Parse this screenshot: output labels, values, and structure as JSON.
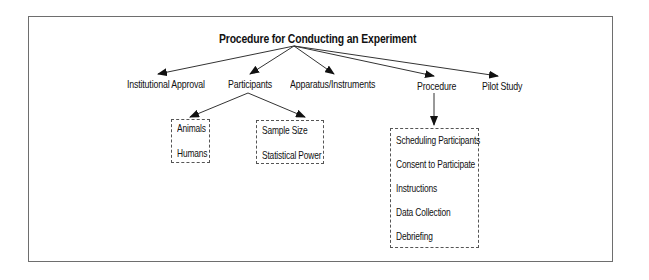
{
  "diagram": {
    "title": "Procedure for Conducting an Experiment",
    "nodes": {
      "institutional": "Institutional Approval",
      "participants": "Participants",
      "apparatus": "Apparatus/Instruments",
      "procedure": "Procedure",
      "pilot": "Pilot Study"
    },
    "participant_groups": {
      "subjects": [
        "Animals",
        "Humans"
      ],
      "sampling": [
        "Sample Size",
        "Statistical Power"
      ]
    },
    "procedure_steps": [
      "Scheduling Participants",
      "Consent to Participate",
      "Instructions",
      "Data Collection",
      "Debriefing"
    ],
    "edges": [
      {
        "from": "title",
        "to": "Institutional Approval"
      },
      {
        "from": "title",
        "to": "Participants"
      },
      {
        "from": "title",
        "to": "Apparatus/Instruments"
      },
      {
        "from": "title",
        "to": "Procedure"
      },
      {
        "from": "title",
        "to": "Pilot Study"
      },
      {
        "from": "Participants",
        "to": "Animals/Humans"
      },
      {
        "from": "Participants",
        "to": "Sample Size/Statistical Power"
      },
      {
        "from": "Procedure",
        "to": "Procedure steps"
      }
    ],
    "colors": {
      "line": "#333333",
      "frame": "#6e6e6e",
      "text": "#111111",
      "dash": "#555555"
    }
  }
}
